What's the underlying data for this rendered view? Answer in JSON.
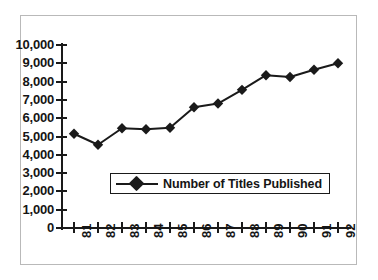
{
  "chart_data": {
    "type": "line",
    "title": "",
    "subtitle": "",
    "xlabel": "",
    "ylabel": "",
    "categories": [
      "81",
      "82",
      "83",
      "84",
      "85",
      "86",
      "87",
      "88",
      "89",
      "90",
      "91",
      "92"
    ],
    "series": [
      {
        "name": "Number of Titles Published",
        "marker": "diamond",
        "color": "#1a1a1a",
        "values": [
          5150,
          4550,
          5450,
          5400,
          5480,
          6600,
          6800,
          7550,
          8350,
          8250,
          8650,
          9000
        ]
      }
    ],
    "ylim": [
      0,
      10000
    ],
    "y_ticks": [
      0,
      1000,
      2000,
      3000,
      4000,
      5000,
      6000,
      7000,
      8000,
      9000,
      10000
    ],
    "y_tick_labels": [
      "0",
      "1,000",
      "2,000",
      "3,000",
      "4,000",
      "5,000",
      "6,000",
      "7,000",
      "8,000",
      "9,000",
      "10,000"
    ],
    "x_tick_labels": [
      "81",
      "82",
      "83",
      "84",
      "85",
      "86",
      "87",
      "88",
      "89",
      "90",
      "91",
      "92"
    ],
    "x_label_rotation": -90,
    "grid": false,
    "legend": {
      "position": "inside-lower-left",
      "entries": [
        {
          "label": "Number of Titles Published",
          "marker": "diamond",
          "color": "#1a1a1a"
        }
      ]
    },
    "annotations": []
  },
  "legend": {
    "label": "Number of Titles Published"
  },
  "colors": {
    "series": "#1a1a1a",
    "axis": "#1a1a1a",
    "text": "#151515",
    "frame": "#b9b9b9",
    "background": "#ffffff"
  }
}
